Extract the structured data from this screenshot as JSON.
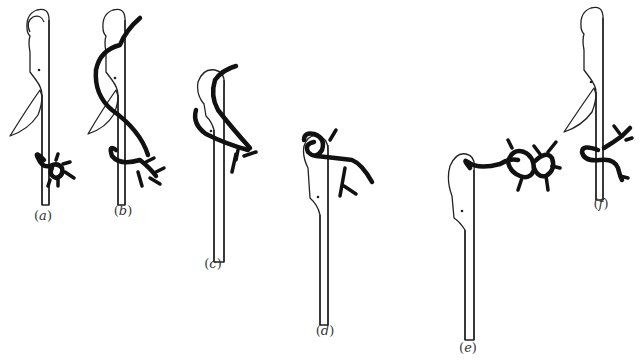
{
  "figure": {
    "ink_color": "#111111",
    "background_color": "#ffffff",
    "panels": [
      {
        "id": "a",
        "label": "(a)",
        "label_letter": "a",
        "label_x": 43,
        "label_y": 217
      },
      {
        "id": "b",
        "label": "(b)",
        "label_letter": "b",
        "label_x": 123,
        "label_y": 212
      },
      {
        "id": "c",
        "label": "(c)",
        "label_letter": "c",
        "label_x": 213,
        "label_y": 264
      },
      {
        "id": "d",
        "label": "(d)",
        "label_letter": "d",
        "label_x": 325,
        "label_y": 331
      },
      {
        "id": "e",
        "label": "(e)",
        "label_letter": "e",
        "label_x": 468,
        "label_y": 346
      },
      {
        "id": "f",
        "label": "(f)",
        "label_letter": "f",
        "label_x": 601,
        "label_y": 204
      }
    ]
  }
}
